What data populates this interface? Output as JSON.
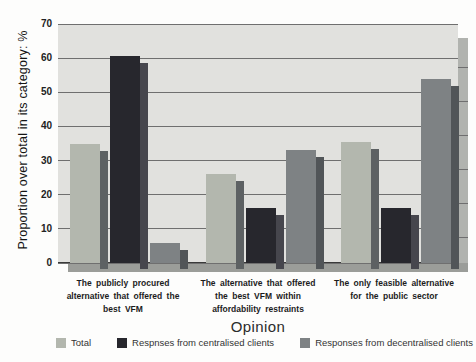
{
  "chart_data": {
    "type": "bar",
    "title": "",
    "xlabel": "Opinion",
    "ylabel": "Proportion over total in its category: %",
    "ylim": [
      0,
      70
    ],
    "yticks": [
      0,
      10,
      20,
      30,
      40,
      50,
      60,
      70
    ],
    "grid": true,
    "legend_position": "bottom",
    "categories": [
      "The publicly procured alternative that offered the best VFM",
      "The alternative that offered the best VFM within affordability restraints",
      "The only feasible alternative for the public sector"
    ],
    "category_lines": [
      "The publicly procured\nalternative that offered the\nbest VFM",
      "The alternative that offered\nthe best VFM within\naffordability restraints",
      "The only feasible alternative\nfor the public sector"
    ],
    "series": [
      {
        "name": "Total",
        "color": "#b3b7ae",
        "shadow_color": "#5d6163",
        "values": [
          35,
          26,
          35.5
        ]
      },
      {
        "name": "Respnses from centralised clients",
        "color": "#27272d",
        "shadow_color": "#46464d",
        "values": [
          60.5,
          16,
          16
        ]
      },
      {
        "name": "Responses from decentralised clients",
        "color": "#7e8284",
        "shadow_color": "#515558",
        "values": [
          6,
          33,
          54
        ]
      }
    ]
  },
  "colors": {
    "page_bg": "#fdfdfc",
    "plot_bg": "#e1e1de",
    "gridline": "#6f6f6f",
    "zero_line": "#3a3a3a",
    "floor": "#9b9d99",
    "wall": "#b1b3af",
    "text": "#1c1c1c"
  }
}
